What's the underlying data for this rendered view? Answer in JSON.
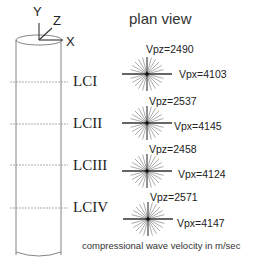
{
  "title": "plan view",
  "axes": {
    "y": "Y",
    "z": "Z",
    "x": "X"
  },
  "caption": "compressional wave velocity in m/sec",
  "levels": [
    {
      "name": "LCI",
      "vpz": "Vpz=2490",
      "vpx": "Vpx=4103"
    },
    {
      "name": "LCII",
      "vpz": "Vpz=2537",
      "vpx": "Vpx=4145"
    },
    {
      "name": "LCIII",
      "vpz": "Vpz=2458",
      "vpx": "Vpx=4124"
    },
    {
      "name": "LCIV",
      "vpz": "Vpz=2571",
      "vpx": "Vpx=4147"
    }
  ],
  "colors": {
    "line": "#555555",
    "ray": "#888888",
    "axisline": "#333333"
  }
}
